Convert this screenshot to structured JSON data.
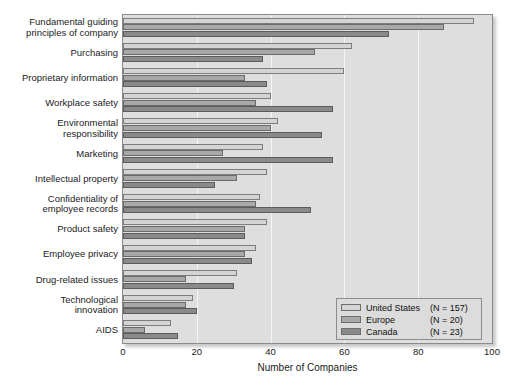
{
  "top_caption": "",
  "chart_data": {
    "type": "bar",
    "orientation": "horizontal",
    "title": "",
    "xlabel": "Number of Companies",
    "ylabel": "",
    "xlim": [
      0,
      100
    ],
    "xticks": [
      0,
      20,
      40,
      60,
      80,
      100
    ],
    "grid": true,
    "legend_position": "bottom-right",
    "categories": [
      "Fundamental guiding principles of company",
      "Purchasing",
      "Proprietary information",
      "Workplace safety",
      "Environmental responsibility",
      "Marketing",
      "Intellectual property",
      "Confidentiality of employee records",
      "Product safety",
      "Employee privacy",
      "Drug-related issues",
      "Technological innovation",
      "AIDS"
    ],
    "series": [
      {
        "name": "United States",
        "n_label": "(N = 157)",
        "color": "#d4d4d4",
        "values": [
          95,
          62,
          60,
          40,
          42,
          38,
          39,
          37,
          39,
          36,
          31,
          19,
          13
        ]
      },
      {
        "name": "Europe",
        "n_label": "(N = 20)",
        "color": "#a8a8a8",
        "values": [
          87,
          52,
          33,
          36,
          40,
          27,
          31,
          36,
          33,
          33,
          17,
          17,
          6
        ]
      },
      {
        "name": "Canada",
        "n_label": "(N = 23)",
        "color": "#8a8a8a",
        "values": [
          72,
          38,
          39,
          57,
          54,
          57,
          25,
          51,
          33,
          35,
          30,
          20,
          15
        ]
      }
    ]
  },
  "ylabel_lines": [
    [
      "Fundamental guiding",
      "principles of company"
    ],
    [
      "Purchasing"
    ],
    [
      "Proprietary information"
    ],
    [
      "Workplace safety"
    ],
    [
      "Environmental",
      "responsibility"
    ],
    [
      "Marketing"
    ],
    [
      "Intellectual property"
    ],
    [
      "Confidentiality of",
      "employee records"
    ],
    [
      "Product safety"
    ],
    [
      "Employee privacy"
    ],
    [
      "Drug-related issues"
    ],
    [
      "Technological",
      "innovation"
    ],
    [
      "AIDS"
    ]
  ]
}
